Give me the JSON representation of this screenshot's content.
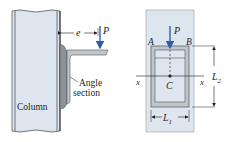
{
  "colors": {
    "column_fill": "#dde6ef",
    "column_edge": "#555555",
    "angle_fill": "#bfc6cc",
    "angle_dark": "#8c9298",
    "load_arrow": "#2e5fa8",
    "text": "#231f20"
  },
  "left_figure": {
    "column_label": "Column",
    "angle_label_line1": "Angle",
    "angle_label_line2": "section",
    "eccentricity_label": "e",
    "load_label": "P"
  },
  "right_figure": {
    "load_label": "P",
    "corner_a": "A",
    "corner_b": "B",
    "centroid_label": "C",
    "axis_left": "x",
    "axis_right": "x",
    "width_label": "L",
    "width_sub": "1",
    "height_label": "L",
    "height_sub": "2"
  }
}
